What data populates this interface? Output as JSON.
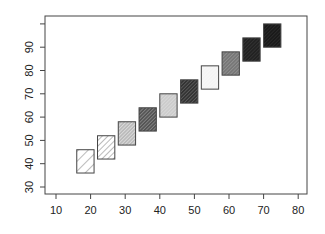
{
  "chart_data": {
    "type": "rect",
    "title": "",
    "xlabel": "",
    "ylabel": "",
    "xlim": [
      8,
      82
    ],
    "ylim": [
      27,
      103
    ],
    "xticks": [
      10,
      20,
      30,
      40,
      50,
      60,
      70,
      80
    ],
    "yticks": [
      30,
      40,
      50,
      60,
      70,
      80,
      90,
      100
    ],
    "ytick_labels": [
      "30",
      "40",
      "50",
      "60",
      "70",
      "80",
      "90",
      ""
    ],
    "grid": false,
    "legend": null,
    "rects": [
      {
        "x0": 16,
        "x1": 21,
        "y0": 36,
        "y1": 46,
        "fill": "#ffffff",
        "hatch": "#555555",
        "density": "low"
      },
      {
        "x0": 22,
        "x1": 27,
        "y0": 42,
        "y1": 52,
        "fill": "#ffffff",
        "hatch": "#555555",
        "density": "mid"
      },
      {
        "x0": 28,
        "x1": 33,
        "y0": 48,
        "y1": 58,
        "fill": "#bbbbbb",
        "hatch": "#ffffff",
        "density": "high"
      },
      {
        "x0": 34,
        "x1": 39,
        "y0": 54,
        "y1": 64,
        "fill": "#555555",
        "hatch": "#bbbbbb",
        "density": "high"
      },
      {
        "x0": 40,
        "x1": 45,
        "y0": 60,
        "y1": 70,
        "fill": "#cccccc",
        "hatch": "#e8e8e8",
        "density": "high"
      },
      {
        "x0": 46,
        "x1": 51,
        "y0": 66,
        "y1": 76,
        "fill": "#333333",
        "hatch": "#888888",
        "density": "high"
      },
      {
        "x0": 52,
        "x1": 57,
        "y0": 72,
        "y1": 82,
        "fill": "#f4f4f4",
        "hatch": "#fafafa",
        "density": "high"
      },
      {
        "x0": 58,
        "x1": 63,
        "y0": 78,
        "y1": 88,
        "fill": "#777777",
        "hatch": "#aaaaaa",
        "density": "high"
      },
      {
        "x0": 64,
        "x1": 69,
        "y0": 84,
        "y1": 94,
        "fill": "#222222",
        "hatch": "#444444",
        "density": "high"
      },
      {
        "x0": 70,
        "x1": 75,
        "y0": 90,
        "y1": 100,
        "fill": "#1a1a1a",
        "hatch": "#3a3a3a",
        "density": "high"
      }
    ]
  }
}
